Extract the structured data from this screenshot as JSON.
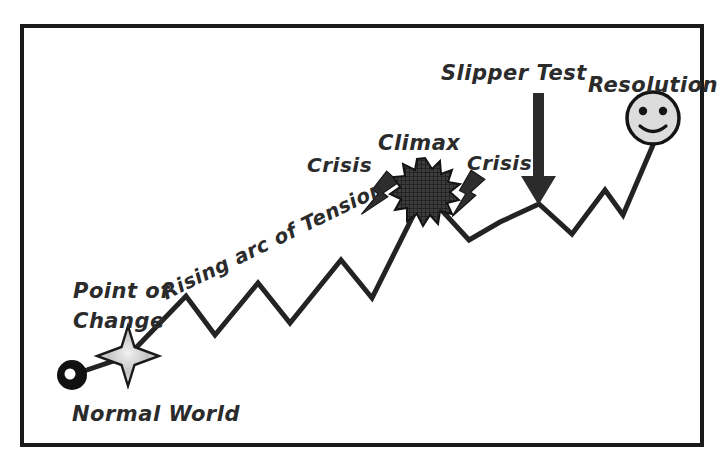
{
  "figure": {
    "kind": "story-arc-diagram",
    "background_color": "#ffffff",
    "frame": {
      "name": "outer-border",
      "stroke_color": "#1a1a1a",
      "x": 22,
      "y": 26,
      "width": 680,
      "height": 419
    },
    "line": {
      "name": "tension-zigzag-line",
      "stroke_color": "#232323",
      "stroke_width": 5
    }
  },
  "labels": {
    "normal_world": "Normal World",
    "point_of_change_line1": "Point of",
    "point_of_change_line2": "Change",
    "rising_arc": "Rising arc of Tension",
    "crisis_left": "Crisis",
    "climax": "Climax",
    "crisis_right": "Crisis",
    "slipper_test": "Slipper Test",
    "resolution": "Resolution"
  },
  "markers": {
    "normal_world_ring": {
      "icon": "black-ring-icon",
      "fill": "#111111",
      "hole_fill": "#ffffff",
      "cx": 72,
      "cy": 375,
      "r": 15
    },
    "point_of_change_star": {
      "icon": "sparkle-star-icon",
      "fill": "#c9c9c9",
      "stroke": "#1a1a1a",
      "cx": 128,
      "cy": 356
    },
    "crisis_bolt_left": {
      "icon": "lightning-bolt-icon",
      "fill": "#2e2e2e"
    },
    "climax_burst": {
      "icon": "explosion-starburst-icon",
      "fill": "#3a3a3a",
      "stroke": "#141414",
      "cx": 425,
      "cy": 192
    },
    "crisis_bolt_right": {
      "icon": "lightning-bolt-icon",
      "fill": "#2e2e2e"
    },
    "slipper_test_arrow": {
      "icon": "down-arrow-icon",
      "fill": "#2b2b2b",
      "x": 539,
      "y_top": 93,
      "y_tip": 204
    },
    "resolution_face": {
      "icon": "smiley-face-icon",
      "fill": "#dcdcdc",
      "stroke": "#141414",
      "cx": 653,
      "cy": 118,
      "r": 26
    }
  },
  "chart_data": {
    "type": "line",
    "title": "Rising arc of Tension",
    "xlabel": "",
    "ylabel": "",
    "grid": false,
    "legend": "none",
    "annotations": [
      "Normal World",
      "Point of Change",
      "Rising arc of Tension",
      "Crisis",
      "Climax",
      "Crisis",
      "Slipper Test",
      "Resolution"
    ],
    "series": [
      {
        "name": "tension",
        "points": [
          [
            72,
            375
          ],
          [
            128,
            356
          ],
          [
            186,
            296
          ],
          [
            215,
            335
          ],
          [
            258,
            283
          ],
          [
            290,
            323
          ],
          [
            341,
            260
          ],
          [
            372,
            298
          ],
          [
            425,
            192
          ],
          [
            469,
            240
          ],
          [
            500,
            222
          ],
          [
            539,
            204
          ],
          [
            572,
            234
          ],
          [
            605,
            190
          ],
          [
            623,
            215
          ],
          [
            653,
            145
          ]
        ]
      }
    ]
  }
}
